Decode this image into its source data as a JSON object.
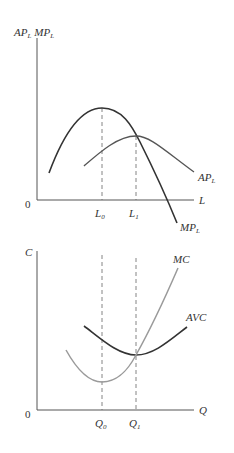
{
  "diagram": {
    "top_panel": {
      "y_axis_label": {
        "main1": "AP",
        "sub1": "L",
        "main2": "MP",
        "sub2": "L"
      },
      "x_axis_label": "L",
      "origin_label": "0",
      "x_ticks": [
        {
          "main": "L",
          "sub": "0"
        },
        {
          "main": "L",
          "sub": "1"
        }
      ],
      "curves": [
        {
          "name": "MP",
          "sub": "L",
          "description": "Marginal product of labor: rises, peaks at L0, then falls, crossing AP at its maximum (L1)"
        },
        {
          "name": "AP",
          "sub": "L",
          "description": "Average product of labor: rises, peaks at L1, then falls"
        }
      ]
    },
    "bottom_panel": {
      "y_axis_label": "C",
      "x_axis_label": "Q",
      "origin_label": "0",
      "x_ticks": [
        {
          "main": "Q",
          "sub": "0"
        },
        {
          "main": "Q",
          "sub": "1"
        }
      ],
      "curves": [
        {
          "name": "MC",
          "description": "Marginal cost: U-shaped, minimum at Q0, crosses AVC at its minimum (Q1)"
        },
        {
          "name": "AVC",
          "description": "Average variable cost: U-shaped, minimum at Q1"
        }
      ]
    },
    "colors": {
      "axis": "#555555",
      "mp_curve": "#333333",
      "ap_curve": "#555555",
      "avc_curve": "#333333",
      "mc_curve": "#9a9a9a",
      "dashed": "#666666",
      "text": "#333333"
    }
  }
}
